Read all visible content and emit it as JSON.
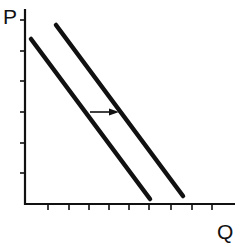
{
  "diagram": {
    "type": "supply-demand-shift",
    "y_axis_label": "P",
    "x_axis_label": "Q",
    "colors": {
      "line": "#111111",
      "background": "#ffffff"
    },
    "y_ticks": [
      20,
      51,
      81,
      112,
      143,
      173
    ],
    "x_ticks": [
      48,
      69,
      89,
      109,
      129,
      149,
      171,
      192,
      212
    ],
    "curves": [
      {
        "name": "original-curve",
        "x1": 31,
        "y1": 39,
        "x2": 150,
        "y2": 199
      },
      {
        "name": "shifted-curve",
        "x1": 56,
        "y1": 25,
        "x2": 183,
        "y2": 196
      }
    ],
    "shift_arrow": {
      "direction": "right",
      "x1": 90,
      "y1": 112,
      "x2": 119,
      "y2": 112
    }
  }
}
